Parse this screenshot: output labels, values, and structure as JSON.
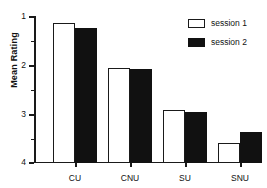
{
  "chart_data": {
    "type": "bar",
    "title": "",
    "xlabel": "",
    "ylabel": "Mean Rating",
    "categories": [
      "CU",
      "CNU",
      "SU",
      "SNU"
    ],
    "series": [
      {
        "name": "session 1",
        "color": "#ffffff",
        "values": [
          1.14,
          2.06,
          2.92,
          3.6
        ]
      },
      {
        "name": "session 2",
        "color": "#111111",
        "values": [
          1.25,
          2.08,
          2.96,
          3.37
        ]
      }
    ],
    "ylim": [
      1,
      4
    ],
    "y_inverted": true,
    "y_baseline": 4,
    "yticks_major": [
      1,
      2,
      3,
      4
    ],
    "yticks_minor": [
      1.5,
      2.5,
      3.5
    ],
    "ytick_labels": [
      "1",
      "2",
      "3",
      "4"
    ],
    "grid": false,
    "legend_position": "top-right",
    "legend_entries": [
      "session 1",
      "session 2"
    ]
  },
  "axis": {
    "y_title": "Mean Rating",
    "y_labels": {
      "t1": "1",
      "t2": "2",
      "t3": "3",
      "t4": "4"
    },
    "x_labels": {
      "c0": "CU",
      "c1": "CNU",
      "c2": "SU",
      "c3": "SNU"
    }
  },
  "legend": {
    "session1_label": "session 1",
    "session2_label": "session 2"
  }
}
